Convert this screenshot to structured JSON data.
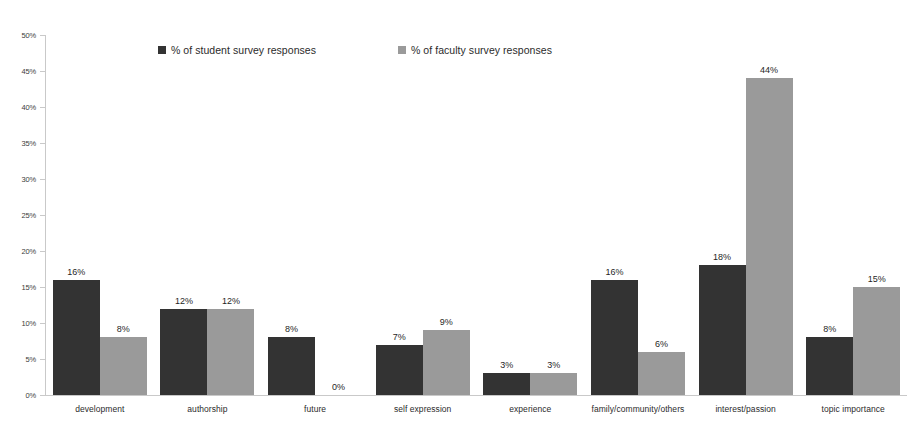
{
  "chart_data": {
    "type": "bar",
    "title": "",
    "xlabel": "",
    "ylabel": "",
    "ylim": [
      0,
      50
    ],
    "y_tick_labels": [
      "0%",
      "5%",
      "10%",
      "15%",
      "20%",
      "25%",
      "30%",
      "35%",
      "40%",
      "45%",
      "50%"
    ],
    "y_tick_values": [
      0,
      5,
      10,
      15,
      20,
      25,
      30,
      35,
      40,
      45,
      50
    ],
    "grid": false,
    "legend_position": "top-center",
    "categories": [
      "development",
      "authorship",
      "future",
      "self expression",
      "experience",
      "family/community/others",
      "interest/passion",
      "topic importance"
    ],
    "series": [
      {
        "name": "% of student survey responses",
        "color": "#333333",
        "values": [
          16,
          12,
          8,
          7,
          3,
          16,
          18,
          8
        ],
        "labels": [
          "16%",
          "12%",
          "8%",
          "7%",
          "3%",
          "16%",
          "18%",
          "8%"
        ]
      },
      {
        "name": "% of faculty survey responses",
        "color": "#9a9a9a",
        "values": [
          8,
          12,
          0,
          9,
          3,
          6,
          44,
          15
        ],
        "labels": [
          "8%",
          "12%",
          "0%",
          "9%",
          "3%",
          "6%",
          "44%",
          "15%"
        ]
      }
    ]
  },
  "legend": {
    "entries": [
      {
        "label": "% of student survey responses",
        "color": "#333333"
      },
      {
        "label": "% of faculty survey responses",
        "color": "#9a9a9a"
      }
    ]
  }
}
